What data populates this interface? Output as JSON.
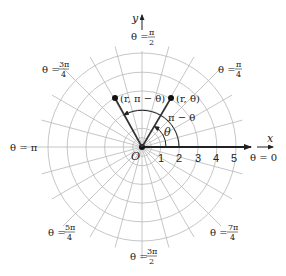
{
  "diagram": {
    "center": {
      "x": 142,
      "y": 147
    },
    "unit_px": 18.7,
    "rings": [
      0.5,
      1,
      2,
      3,
      4,
      5
    ],
    "radial_step_deg": 15,
    "axis_labels": {
      "x": "x",
      "y": "y",
      "origin": "O"
    },
    "radius_ticks": [
      "1",
      "2",
      "3",
      "4",
      "5"
    ],
    "angle_labels": [
      {
        "id": "zero",
        "text": "θ = 0"
      },
      {
        "id": "pi-over-4",
        "prefix": "θ = ",
        "num": "π",
        "den": "4"
      },
      {
        "id": "pi-over-2",
        "prefix": "θ = ",
        "num": "π",
        "den": "2"
      },
      {
        "id": "3pi-over-4",
        "prefix": "θ = ",
        "num": "3π",
        "den": "4"
      },
      {
        "id": "pi",
        "text": "θ = π"
      },
      {
        "id": "5pi-over-4",
        "prefix": "θ = ",
        "num": "5π",
        "den": "4"
      },
      {
        "id": "3pi-over-2",
        "prefix": "θ = ",
        "num": "3π",
        "den": "2"
      },
      {
        "id": "7pi-over-4",
        "prefix": "θ = ",
        "num": "7π",
        "den": "4"
      }
    ],
    "points": [
      {
        "label": "(r, θ)",
        "r": 3,
        "theta_deg": 59
      },
      {
        "label": "(r, π − θ)",
        "r": 3,
        "theta_deg": 121
      }
    ],
    "arc_labels": {
      "theta": "θ",
      "pi_minus_theta": "π − θ"
    },
    "colors": {
      "grid": "#b8b8b8",
      "ink": "#222222",
      "ray": "#333333"
    }
  }
}
